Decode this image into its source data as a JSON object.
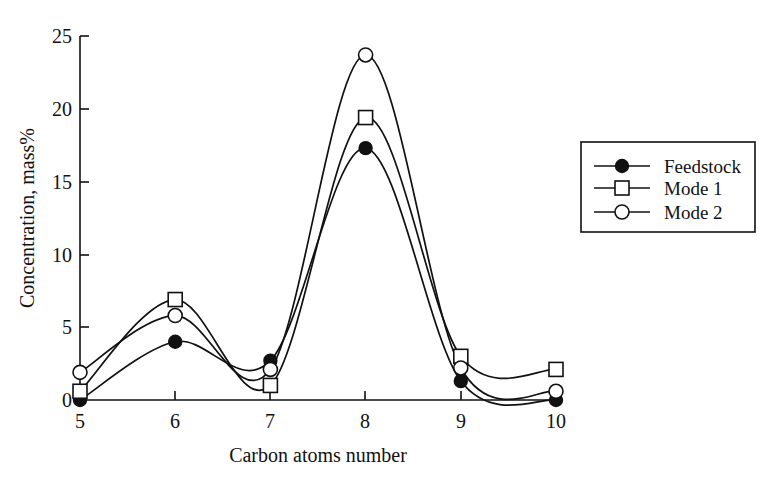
{
  "chart_data": {
    "type": "line",
    "title": "",
    "xlabel": "Carbon atoms number",
    "ylabel": "Concentration, mass%",
    "x": [
      5,
      6,
      7,
      8,
      9,
      10
    ],
    "xticklabels": [
      "5",
      "6",
      "7",
      "8",
      "9",
      "10"
    ],
    "yticklabels": [
      "0",
      "5",
      "10",
      "15",
      "20",
      "25"
    ],
    "yticks": [
      0,
      5,
      10,
      15,
      20,
      25
    ],
    "xlim": [
      5,
      10
    ],
    "ylim": [
      0,
      25
    ],
    "grid": false,
    "legend_position": "right",
    "series": [
      {
        "name": "Feedstock",
        "marker": "filled-circle",
        "values": [
          0.0,
          4.0,
          2.7,
          17.3,
          1.3,
          0.0
        ]
      },
      {
        "name": "Mode 1",
        "marker": "open-square",
        "values": [
          0.6,
          6.9,
          1.0,
          19.4,
          3.0,
          2.1
        ]
      },
      {
        "name": "Mode 2",
        "marker": "open-circle",
        "values": [
          1.9,
          5.8,
          2.1,
          23.7,
          2.2,
          0.6
        ]
      }
    ]
  },
  "legend": {
    "entries": [
      {
        "label": "Feedstock",
        "marker": "filled-circle-icon"
      },
      {
        "label": "Mode 1",
        "marker": "open-square-icon"
      },
      {
        "label": "Mode 2",
        "marker": "open-circle-icon"
      }
    ]
  },
  "axes": {
    "x_title": "Carbon atoms number",
    "y_title": "Concentration, mass%"
  }
}
